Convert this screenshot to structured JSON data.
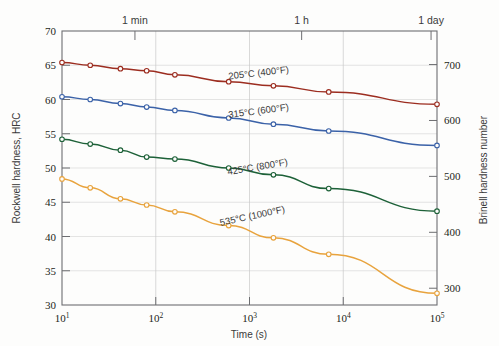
{
  "chart_data": {
    "type": "line",
    "title": "",
    "xlabel": "Time (s)",
    "ylabel": "Rockwell hardness, HRC",
    "y2label": "Brinell hardness number",
    "xscale": "log",
    "xlim": [
      10,
      100000
    ],
    "ylim": [
      30,
      70
    ],
    "y2lim": [
      270,
      760
    ],
    "grid": true,
    "legend_position": "inline-labels",
    "xticks": [
      {
        "value": 10,
        "label": "10",
        "exponent": "1"
      },
      {
        "value": 100,
        "label": "10",
        "exponent": "2"
      },
      {
        "value": 1000,
        "label": "10",
        "exponent": "3"
      },
      {
        "value": 10000,
        "label": "10",
        "exponent": "4"
      },
      {
        "value": 100000,
        "label": "10",
        "exponent": "5"
      }
    ],
    "yticks": [
      30,
      35,
      40,
      45,
      50,
      55,
      60,
      65,
      70
    ],
    "y2ticks": [
      300,
      400,
      500,
      600,
      700
    ],
    "top_axis_ticks": [
      {
        "value": 60,
        "label": "1 min"
      },
      {
        "value": 3600,
        "label": "1 h"
      },
      {
        "value": 86400,
        "label": "1 day"
      }
    ],
    "series": [
      {
        "name": "205°C (400°F)",
        "label": "205°C (400°F)",
        "color": "#9c2d20",
        "marker": "open-circle",
        "points": [
          {
            "x": 10,
            "y": 65.4
          },
          {
            "x": 20,
            "y": 65.0
          },
          {
            "x": 42,
            "y": 64.5
          },
          {
            "x": 80,
            "y": 64.2
          },
          {
            "x": 160,
            "y": 63.6
          },
          {
            "x": 600,
            "y": 62.6
          },
          {
            "x": 1800,
            "y": 62.0
          },
          {
            "x": 7000,
            "y": 61.1
          },
          {
            "x": 100000,
            "y": 59.3
          }
        ]
      },
      {
        "name": "315°C (600°F)",
        "label": "315°C (600°F)",
        "color": "#3b62a8",
        "marker": "open-circle",
        "points": [
          {
            "x": 10,
            "y": 60.4
          },
          {
            "x": 20,
            "y": 60.0
          },
          {
            "x": 42,
            "y": 59.4
          },
          {
            "x": 80,
            "y": 58.9
          },
          {
            "x": 160,
            "y": 58.4
          },
          {
            "x": 600,
            "y": 57.3
          },
          {
            "x": 1800,
            "y": 56.4
          },
          {
            "x": 7000,
            "y": 55.4
          },
          {
            "x": 100000,
            "y": 53.3
          }
        ]
      },
      {
        "name": "425°C (800°F)",
        "label": "425°C (800°F)",
        "color": "#1d6138",
        "marker": "open-circle",
        "points": [
          {
            "x": 10,
            "y": 54.2
          },
          {
            "x": 20,
            "y": 53.5
          },
          {
            "x": 42,
            "y": 52.6
          },
          {
            "x": 80,
            "y": 51.6
          },
          {
            "x": 160,
            "y": 51.3
          },
          {
            "x": 600,
            "y": 50.0
          },
          {
            "x": 1800,
            "y": 49.0
          },
          {
            "x": 7000,
            "y": 47.0
          },
          {
            "x": 100000,
            "y": 43.7
          }
        ]
      },
      {
        "name": "535°C (1000°F)",
        "label": "535°C (1000°F)",
        "color": "#e8a33d",
        "marker": "open-circle",
        "points": [
          {
            "x": 10,
            "y": 48.4
          },
          {
            "x": 20,
            "y": 47.1
          },
          {
            "x": 42,
            "y": 45.5
          },
          {
            "x": 80,
            "y": 44.6
          },
          {
            "x": 160,
            "y": 43.6
          },
          {
            "x": 600,
            "y": 41.6
          },
          {
            "x": 1800,
            "y": 39.8
          },
          {
            "x": 7000,
            "y": 37.4
          },
          {
            "x": 100000,
            "y": 31.7
          }
        ]
      }
    ],
    "annotations": [
      {
        "text": "205°C (400°F)",
        "x_px": 259,
        "y_px": 76,
        "rotate": -6.5
      },
      {
        "text": "315°C (600°F)",
        "x_px": 259,
        "y_px": 114,
        "rotate": -7.5
      },
      {
        "text": "425°C (800°F)",
        "x_px": 258,
        "y_px": 170,
        "rotate": -9.5
      },
      {
        "text": "535°C (1000°F)",
        "x_px": 253,
        "y_px": 219,
        "rotate": -12
      }
    ]
  }
}
